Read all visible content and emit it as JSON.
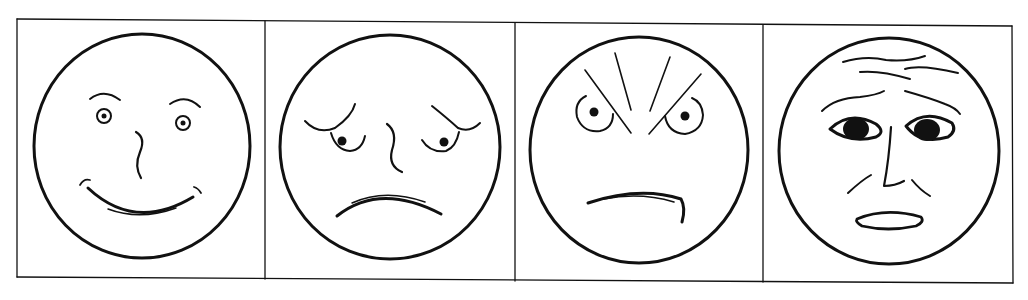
{
  "figure": {
    "type": "emotion-faces-strip",
    "panel_count": 4,
    "line_color": "#111111",
    "background": "#ffffff",
    "panels": [
      {
        "index": 1,
        "emotion": "happy"
      },
      {
        "index": 2,
        "emotion": "sad"
      },
      {
        "index": 3,
        "emotion": "angry"
      },
      {
        "index": 4,
        "emotion": "fearful"
      }
    ]
  }
}
